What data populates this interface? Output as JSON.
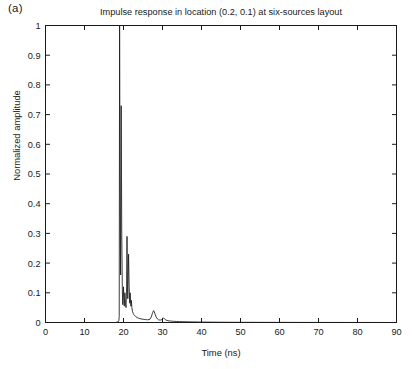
{
  "figure": {
    "panel_label": "(a)",
    "title": "Impulse response in location (0.2, 0.1) at six-sources layout",
    "xlabel": "Time (ns)",
    "ylabel": "Normalized amplitude",
    "line_color": "#1a1a1a",
    "background_color": "#ffffff",
    "axis_color": "#1a1a1a"
  },
  "chart_data": {
    "type": "line",
    "title": "Impulse response in location (0.2, 0.1) at six-sources layout",
    "xlabel": "Time (ns)",
    "ylabel": "Normalized amplitude",
    "xlim": [
      0,
      90
    ],
    "ylim": [
      0,
      1
    ],
    "xticks": [
      0,
      10,
      20,
      30,
      40,
      50,
      60,
      70,
      80,
      90
    ],
    "xticklabels": [
      "0",
      "10",
      "20",
      "30",
      "40",
      "50",
      "60",
      "70",
      "80",
      "90"
    ],
    "yticks": [
      0,
      0.1,
      0.2,
      0.3,
      0.4,
      0.5,
      0.6,
      0.7,
      0.8,
      0.9,
      1
    ],
    "yticklabels": [
      "0",
      "0.1",
      "0.2",
      "0.3",
      "0.4",
      "0.5",
      "0.6",
      "0.7",
      "0.8",
      "0.9",
      "1"
    ],
    "grid": false,
    "legend": null,
    "series": [
      {
        "name": "Impulse response",
        "color": "#1a1a1a",
        "x": [
          0,
          5,
          10,
          14,
          16,
          18,
          18.6,
          18.8,
          18.9,
          19.0,
          19.1,
          19.25,
          19.4,
          19.55,
          19.7,
          19.8,
          19.9,
          20.0,
          20.1,
          20.2,
          20.35,
          20.5,
          20.65,
          20.8,
          20.9,
          21.0,
          21.1,
          21.2,
          21.3,
          21.45,
          21.6,
          21.7,
          21.8,
          21.9,
          22.0,
          22.15,
          22.3,
          22.5,
          22.7,
          22.9,
          23.2,
          23.6,
          24.0,
          24.5,
          25.0,
          25.6,
          26.2,
          26.8,
          27.1,
          27.4,
          27.7,
          27.9,
          28.1,
          28.4,
          28.7,
          29.0,
          29.4,
          29.8,
          30.0,
          30.2,
          30.5,
          30.9,
          31.4,
          32.0,
          32.8,
          33.6,
          34.4,
          35.2,
          36.0,
          37.0,
          38.0,
          39.5,
          41.0,
          43.0,
          45.0,
          48.0,
          51.0,
          55.0,
          60.0,
          65.0,
          70.0,
          75.0,
          80.0,
          85.0,
          90.0
        ],
        "y": [
          0,
          0,
          0,
          0,
          0,
          0,
          0.002,
          0.006,
          0.02,
          1.0,
          0.5,
          0.16,
          0.73,
          0.3,
          0.11,
          0.06,
          0.085,
          0.12,
          0.08,
          0.055,
          0.1,
          0.065,
          0.05,
          0.12,
          0.29,
          0.14,
          0.08,
          0.155,
          0.23,
          0.12,
          0.065,
          0.1,
          0.075,
          0.055,
          0.075,
          0.05,
          0.038,
          0.03,
          0.026,
          0.023,
          0.019,
          0.016,
          0.014,
          0.012,
          0.011,
          0.01,
          0.009,
          0.011,
          0.018,
          0.03,
          0.04,
          0.036,
          0.028,
          0.018,
          0.012,
          0.009,
          0.008,
          0.009,
          0.013,
          0.016,
          0.012,
          0.008,
          0.006,
          0.005,
          0.004,
          0.0035,
          0.003,
          0.0028,
          0.0025,
          0.0022,
          0.002,
          0.0017,
          0.0014,
          0.0011,
          0.0009,
          0.0007,
          0.0006,
          0.0005,
          0.0004,
          0.0003,
          0.0002,
          0.0002,
          0.0001,
          0.0001,
          0.0
        ]
      }
    ],
    "annotations": [
      {
        "label": "main-spike",
        "x": 19.0,
        "y": 1.0
      },
      {
        "label": "secondary-spike",
        "x": 19.4,
        "y": 0.73
      },
      {
        "label": "third-spike",
        "x": 20.9,
        "y": 0.29
      },
      {
        "label": "fourth-spike",
        "x": 21.3,
        "y": 0.23
      },
      {
        "label": "late-bump",
        "x": 27.9,
        "y": 0.04
      }
    ]
  }
}
